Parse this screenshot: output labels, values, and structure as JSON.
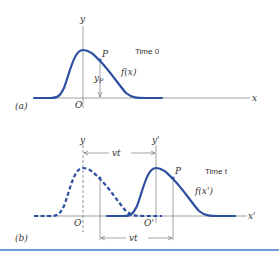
{
  "figure": {
    "panel_a": {
      "label": "(a)",
      "y_axis": "y",
      "x_axis": "x",
      "origin": "O",
      "point": "P",
      "point_height": "yP",
      "point_height_main": "y",
      "point_height_sub": "P",
      "function": "f(x)",
      "time_label": "Time 0"
    },
    "panel_b": {
      "label": "(b)",
      "y_axis_old": "y",
      "y_axis_new": "y'",
      "x_axis": "x'",
      "origin_old": "O",
      "origin_new": "O'",
      "point": "P",
      "function": "f(x')",
      "time_label": "Time t",
      "displacement_top": "vt",
      "displacement_bottom": "vt"
    },
    "colors": {
      "curve": "#2b4ea0",
      "axis": "#8a8a8a",
      "footer_rule": "#6f9bd6"
    }
  }
}
